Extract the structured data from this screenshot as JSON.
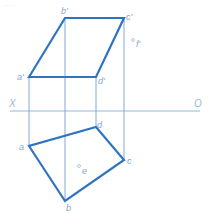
{
  "header": {
    "faded_text": "……"
  },
  "colors": {
    "edge": "#2f74c0",
    "projection_line": "#5b95d0",
    "axis": "#7aa6d6",
    "label": "#7fa6cf",
    "background": "#ffffff"
  },
  "axis": {
    "left_label": "X",
    "right_label": "O",
    "y": 111,
    "x_start": 10,
    "x_end": 200
  },
  "frontal_view": {
    "name": "V-projection",
    "points": {
      "a": {
        "label": "a'",
        "x": 29,
        "y": 77
      },
      "b": {
        "label": "b'",
        "x": 65,
        "y": 18
      },
      "c": {
        "label": "c'",
        "x": 124,
        "y": 18
      },
      "d": {
        "label": "d'",
        "x": 96,
        "y": 77
      }
    },
    "extra_point": {
      "label": "f'",
      "x": 133,
      "y": 40
    }
  },
  "horizontal_view": {
    "name": "H-projection",
    "points": {
      "a": {
        "label": "a",
        "x": 29,
        "y": 146
      },
      "b": {
        "label": "b",
        "x": 65,
        "y": 201
      },
      "c": {
        "label": "c",
        "x": 124,
        "y": 160
      },
      "d": {
        "label": "d",
        "x": 96,
        "y": 127
      }
    },
    "extra_point": {
      "label": "e",
      "x": 80,
      "y": 167
    }
  },
  "projection_lines": [
    {
      "for": "a",
      "x": 29,
      "y1": 77,
      "y2": 146
    },
    {
      "for": "b",
      "x": 65,
      "y1": 18,
      "y2": 201
    },
    {
      "for": "d",
      "x": 96,
      "y1": 77,
      "y2": 127
    },
    {
      "for": "c",
      "x": 124,
      "y1": 18,
      "y2": 160
    }
  ]
}
